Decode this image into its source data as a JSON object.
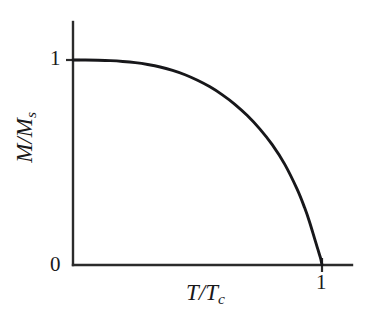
{
  "figure": {
    "background_color": "#ffffff",
    "ink_color": "#1a1a1a",
    "curve_color": "#17171a"
  },
  "axes": {
    "x_title_main": "T/T",
    "x_title_sub": "c",
    "y_title_main": "M/M",
    "y_title_sub": "s",
    "x_ticks": [
      "1"
    ],
    "y_ticks": [
      "0",
      "1"
    ],
    "y_tick_top_label": "1",
    "y_tick_bottom_label": "0",
    "x_tick_label": "1"
  },
  "chart_data": {
    "type": "line",
    "title": "",
    "xlabel": "T/Tc",
    "ylabel": "M/Ms",
    "xlim": [
      0,
      1.12
    ],
    "ylim": [
      0,
      1.08
    ],
    "grid": false,
    "legend": "none",
    "x_tick_values": [
      1
    ],
    "y_tick_values": [
      0,
      1
    ],
    "series": [
      {
        "name": "Spontaneous magnetization (mean-field / Brillouin)",
        "x": [
          0.0,
          0.05,
          0.1,
          0.15,
          0.2,
          0.25,
          0.3,
          0.35,
          0.4,
          0.45,
          0.5,
          0.55,
          0.6,
          0.65,
          0.7,
          0.75,
          0.8,
          0.85,
          0.9,
          0.93,
          0.95,
          0.97,
          0.98,
          0.99,
          0.995,
          1.0
        ],
        "y": [
          1.0,
          1.0,
          0.999,
          0.997,
          0.993,
          0.987,
          0.978,
          0.966,
          0.949,
          0.928,
          0.901,
          0.869,
          0.83,
          0.784,
          0.729,
          0.664,
          0.587,
          0.492,
          0.37,
          0.28,
          0.21,
          0.13,
          0.09,
          0.05,
          0.03,
          0.0
        ]
      }
    ],
    "annotations": [
      {
        "text": "curve starts flat at M/Ms = 1 for small T/Tc"
      },
      {
        "text": "curve drops near-vertically to 0 at T/Tc = 1"
      }
    ]
  }
}
